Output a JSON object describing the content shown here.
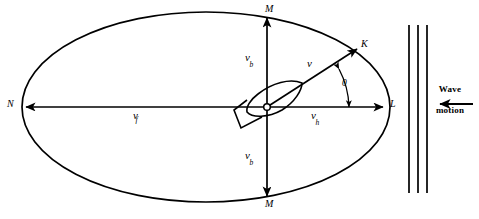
{
  "figure": {
    "type": "physics-vector-diagram",
    "background_color": "#ffffff",
    "stroke_color": "#000000"
  },
  "ellipse": {
    "name": "orbital-path-ellipse",
    "center_x": 206,
    "center_y": 107,
    "radius_x": 184,
    "radius_y": 95,
    "stroke_width": 1.6
  },
  "points": [
    {
      "id": "M-top",
      "label": "M",
      "x": 267,
      "y": 10,
      "role": "upper-vertical-extremum"
    },
    {
      "id": "M-bottom",
      "label": "M",
      "x": 267,
      "y": 204,
      "role": "lower-vertical-extremum"
    },
    {
      "id": "N",
      "label": "N",
      "x": 9,
      "y": 102,
      "role": "left-horizontal-extremum"
    },
    {
      "id": "L",
      "label": "L",
      "x": 390,
      "y": 102,
      "role": "right-horizontal-extremum"
    },
    {
      "id": "K",
      "label": "K",
      "x": 362,
      "y": 44,
      "role": "resultant-velocity-tip"
    }
  ],
  "vectors": [
    {
      "id": "v-b-upper",
      "label": "v",
      "subscript": "b",
      "label_x": 246,
      "label_y": 57,
      "direction": "up",
      "description": "vertical orbital velocity component upward"
    },
    {
      "id": "v-b-lower",
      "label": "v",
      "subscript": "b",
      "label_x": 246,
      "label_y": 155,
      "direction": "down",
      "description": "vertical orbital velocity component downward"
    },
    {
      "id": "v-f",
      "label": "v",
      "subscript": "f",
      "label_x": 134,
      "label_y": 113,
      "direction": "left",
      "description": "horizontal orbital velocity component toward N"
    },
    {
      "id": "v-h",
      "label": "v",
      "subscript": "h",
      "label_x": 312,
      "label_y": 113,
      "direction": "right",
      "description": "horizontal orbital velocity component toward L"
    },
    {
      "id": "v-resultant",
      "label": "v",
      "subscript": "",
      "label_x": 308,
      "label_y": 63,
      "direction": "up-right",
      "description": "resultant velocity vector toward K"
    }
  ],
  "angle": {
    "name": "angle-theta",
    "label": "0",
    "label_x": 343,
    "label_y": 84,
    "description": "angle between resultant velocity and horizontal axis"
  },
  "vessel": {
    "name": "vessel-hull",
    "description": "ship hull plan view at origin, bow up-right",
    "origin_marker": "open-circle"
  },
  "wave_field": {
    "name": "wave-crest-lines",
    "count": 3,
    "x_positions": [
      409,
      418,
      427
    ],
    "y_top": 25,
    "y_bottom": 193,
    "stroke_width": 1.6
  },
  "wave_motion": {
    "name": "wave-motion-annotation",
    "line1": "Wave",
    "line2": "motion",
    "arrow_direction": "left",
    "arrow_x_start": 473,
    "arrow_x_end": 437,
    "arrow_y": 104
  }
}
